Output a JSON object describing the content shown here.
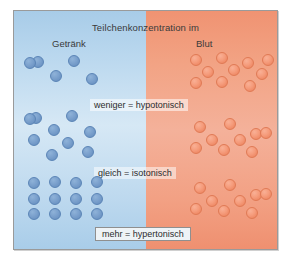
{
  "figure": {
    "title": "Teilchenkonzentration im",
    "left_label": "Getränk",
    "right_label": "Blut",
    "colors": {
      "left_panel": "#bcd8ee",
      "right_panel": "#f2a384",
      "left_particle": "#7ba1cd",
      "right_particle": "#f59c7c",
      "frame_border": "#9a9a9a",
      "text": "#3a3a3a"
    }
  },
  "captions": [
    {
      "id": "hypotonic",
      "text": "weniger = hypotonisch"
    },
    {
      "id": "isotonic",
      "text": "gleich = isotonisch"
    },
    {
      "id": "hypertonic",
      "text": "mehr = hypertonisch"
    }
  ],
  "chart_data": {
    "type": "scatter",
    "title": "Teilchenkonzentration im",
    "xlabel": "",
    "ylabel": "",
    "legend": [
      "Getränk",
      "Blut"
    ],
    "annotations": [
      "weniger = hypotonisch",
      "gleich = isotonisch",
      "mehr = hypertonisch"
    ],
    "series": [
      {
        "name": "Getränk",
        "color": "#7ba1cd",
        "groups": [
          {
            "row": "hypotonisch",
            "count": 5,
            "points": [
              [
                38,
                62
              ],
              [
                74,
                61
              ],
              [
                56,
                76
              ],
              [
                92,
                79
              ],
              [
                30,
                63
              ]
            ]
          },
          {
            "row": "isotonisch",
            "count": 9,
            "points": [
              [
                36,
                118
              ],
              [
                72,
                116
              ],
              [
                54,
                130
              ],
              [
                90,
                132
              ],
              [
                34,
                140
              ],
              [
                68,
                143
              ],
              [
                52,
                155
              ],
              [
                88,
                152
              ],
              [
                30,
                119
              ]
            ]
          },
          {
            "row": "hypertonisch",
            "count": 12,
            "points": [
              [
                34,
                183
              ],
              [
                55,
                182
              ],
              [
                76,
                183
              ],
              [
                97,
                182
              ],
              [
                34,
                199
              ],
              [
                55,
                199
              ],
              [
                76,
                199
              ],
              [
                97,
                199
              ],
              [
                34,
                214
              ],
              [
                55,
                214
              ],
              [
                76,
                214
              ],
              [
                97,
                214
              ]
            ]
          }
        ]
      },
      {
        "name": "Blut",
        "color": "#f59c7c",
        "groups": [
          {
            "row": "hypotonisch",
            "count": 10,
            "points": [
              [
                196,
                60
              ],
              [
                222,
                58
              ],
              [
                248,
                63
              ],
              [
                208,
                72
              ],
              [
                234,
                70
              ],
              [
                262,
                74
              ],
              [
                196,
                83
              ],
              [
                222,
                82
              ],
              [
                250,
                86
              ],
              [
                268,
                60
              ]
            ]
          },
          {
            "row": "isotonisch",
            "count": 9,
            "points": [
              [
                200,
                127
              ],
              [
                230,
                124
              ],
              [
                256,
                134
              ],
              [
                212,
                140
              ],
              [
                240,
                140
              ],
              [
                196,
                148
              ],
              [
                224,
                150
              ],
              [
                252,
                152
              ],
              [
                266,
                133
              ]
            ]
          },
          {
            "row": "hypertonisch",
            "count": 9,
            "points": [
              [
                200,
                188
              ],
              [
                230,
                185
              ],
              [
                256,
                195
              ],
              [
                212,
                201
              ],
              [
                240,
                201
              ],
              [
                196,
                209
              ],
              [
                224,
                211
              ],
              [
                252,
                213
              ],
              [
                266,
                194
              ]
            ]
          }
        ]
      }
    ],
    "summary": [
      {
        "comparison": "weniger = hypotonisch",
        "drink_particles": 5,
        "blood_particles": 10
      },
      {
        "comparison": "gleich = isotonisch",
        "drink_particles": 9,
        "blood_particles": 9
      },
      {
        "comparison": "mehr = hypertonisch",
        "drink_particles": 12,
        "blood_particles": 9
      }
    ]
  }
}
